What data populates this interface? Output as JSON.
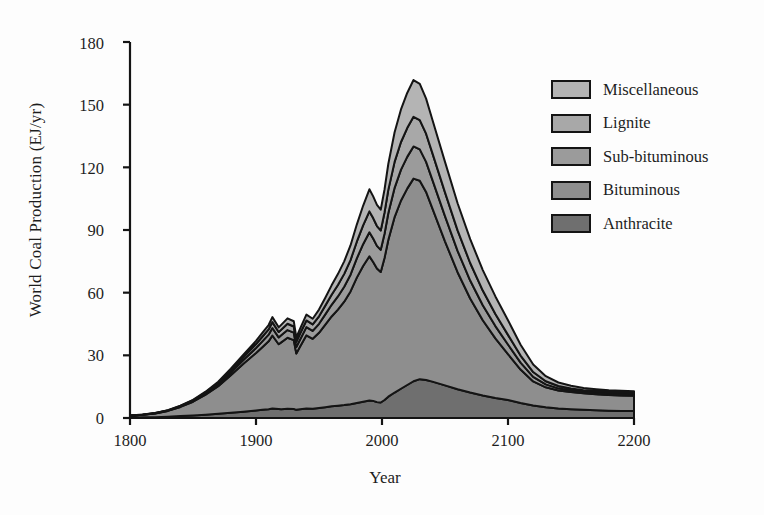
{
  "chart_data": {
    "type": "area",
    "title": "",
    "xlabel": "Year",
    "ylabel": "World Coal Production (EJ/yr)",
    "xlim": [
      1800,
      2200
    ],
    "ylim": [
      0,
      180
    ],
    "xticks": [
      1800,
      1900,
      2000,
      2100,
      2200
    ],
    "yticks": [
      0,
      30,
      60,
      90,
      120,
      150,
      180
    ],
    "grid": false,
    "stacked": true,
    "legend_position": "upper right",
    "legend_order_top_to_bottom": [
      "Miscellaneous",
      "Lignite",
      "Sub-bituminous",
      "Bituminous",
      "Anthracite"
    ],
    "stack_order_bottom_to_top": [
      "Anthracite",
      "Bituminous",
      "Sub-bituminous",
      "Lignite",
      "Miscellaneous"
    ],
    "colors": {
      "Miscellaneous": "#b4b4b4",
      "Lignite": "#a8a8a8",
      "Sub-bituminous": "#9b9b9b",
      "Bituminous": "#8e8e8e",
      "Anthracite": "#6f6f6f",
      "outline": "#141414"
    },
    "x": [
      1800,
      1810,
      1820,
      1830,
      1840,
      1850,
      1860,
      1870,
      1880,
      1890,
      1900,
      1905,
      1910,
      1913,
      1918,
      1920,
      1925,
      1930,
      1932,
      1935,
      1940,
      1945,
      1950,
      1955,
      1960,
      1965,
      1970,
      1975,
      1980,
      1985,
      1990,
      1993,
      1996,
      1999,
      2002,
      2005,
      2010,
      2015,
      2020,
      2025,
      2030,
      2035,
      2040,
      2050,
      2060,
      2070,
      2080,
      2090,
      2100,
      2110,
      2120,
      2130,
      2140,
      2150,
      2160,
      2170,
      2180,
      2190,
      2200
    ],
    "series": [
      {
        "name": "Anthracite",
        "values": [
          0.2,
          0.3,
          0.4,
          0.6,
          0.9,
          1.2,
          1.6,
          2.0,
          2.5,
          3.0,
          3.6,
          3.9,
          4.2,
          4.5,
          4.3,
          4.2,
          4.4,
          4.3,
          3.9,
          4.2,
          4.6,
          4.4,
          4.8,
          5.2,
          5.6,
          5.9,
          6.2,
          6.6,
          7.2,
          7.8,
          8.4,
          8.2,
          7.6,
          7.4,
          8.6,
          10.2,
          12.2,
          14.0,
          15.8,
          17.6,
          18.6,
          18.2,
          17.4,
          15.6,
          13.8,
          12.2,
          10.8,
          9.6,
          8.6,
          7.2,
          6.0,
          5.2,
          4.6,
          4.2,
          3.9,
          3.7,
          3.5,
          3.4,
          3.3
        ]
      },
      {
        "name": "Bituminous",
        "values": [
          0.9,
          1.2,
          1.8,
          2.8,
          4.4,
          6.6,
          9.6,
          13.2,
          18.0,
          23.0,
          27.5,
          30.0,
          32.5,
          35.0,
          31.0,
          32.0,
          34.0,
          33.0,
          27.0,
          30.0,
          35.0,
          33.5,
          36.0,
          39.5,
          43.0,
          46.0,
          49.5,
          54.0,
          60.0,
          65.0,
          69.0,
          66.5,
          64.0,
          62.5,
          68.0,
          75.0,
          84.0,
          90.0,
          94.0,
          97.0,
          95.0,
          90.0,
          83.0,
          69.0,
          56.0,
          45.0,
          36.0,
          28.5,
          22.0,
          16.0,
          11.5,
          9.5,
          8.6,
          8.2,
          7.9,
          7.7,
          7.5,
          7.4,
          7.3
        ]
      },
      {
        "name": "Sub-bituminous",
        "values": [
          0.05,
          0.07,
          0.1,
          0.15,
          0.25,
          0.4,
          0.6,
          0.9,
          1.3,
          1.8,
          2.4,
          2.8,
          3.2,
          3.6,
          3.3,
          3.4,
          3.7,
          3.6,
          3.1,
          3.4,
          3.9,
          3.8,
          4.3,
          4.9,
          5.6,
          6.3,
          7.1,
          8.0,
          9.2,
          10.4,
          11.5,
          11.2,
          10.8,
          10.6,
          11.6,
          12.8,
          14.0,
          14.8,
          15.2,
          15.4,
          15.0,
          14.4,
          13.6,
          12.0,
          10.2,
          8.6,
          7.2,
          5.9,
          4.6,
          3.3,
          2.2,
          1.4,
          1.0,
          0.8,
          0.7,
          0.65,
          0.6,
          0.6,
          0.6
        ]
      },
      {
        "name": "Lignite",
        "values": [
          0.03,
          0.04,
          0.06,
          0.1,
          0.18,
          0.3,
          0.45,
          0.7,
          1.0,
          1.4,
          1.9,
          2.2,
          2.5,
          2.8,
          2.6,
          2.7,
          3.0,
          2.9,
          2.5,
          2.8,
          3.2,
          3.1,
          3.6,
          4.2,
          4.8,
          5.5,
          6.2,
          7.0,
          8.0,
          9.0,
          10.0,
          9.8,
          9.5,
          9.3,
          10.2,
          11.2,
          12.4,
          13.2,
          13.8,
          14.2,
          14.0,
          13.5,
          12.8,
          11.4,
          9.8,
          8.4,
          7.0,
          5.8,
          4.6,
          3.4,
          2.3,
          1.5,
          1.1,
          0.9,
          0.8,
          0.75,
          0.7,
          0.7,
          0.7
        ]
      },
      {
        "name": "Miscellaneous",
        "values": [
          0.02,
          0.03,
          0.05,
          0.08,
          0.14,
          0.22,
          0.35,
          0.55,
          0.8,
          1.1,
          1.5,
          1.8,
          2.1,
          2.4,
          2.2,
          2.3,
          2.6,
          2.5,
          2.1,
          2.4,
          2.8,
          2.7,
          3.2,
          3.8,
          4.5,
          5.2,
          6.0,
          7.0,
          8.2,
          9.4,
          10.6,
          10.4,
          10.1,
          9.9,
          11.0,
          12.4,
          14.2,
          15.6,
          16.8,
          17.6,
          17.4,
          16.8,
          16.0,
          14.6,
          13.0,
          11.4,
          9.8,
          8.4,
          7.0,
          5.2,
          3.6,
          2.4,
          1.7,
          1.3,
          1.1,
          1.0,
          0.95,
          0.9,
          0.9
        ]
      }
    ],
    "peak": {
      "year": 2030,
      "total": 156
    },
    "annotations": []
  },
  "axes": {
    "ylabel": "World Coal Production (EJ/yr)",
    "xlabel": "Year",
    "yticks": [
      "180",
      "150",
      "120",
      "90",
      "60",
      "30",
      "0"
    ],
    "xticks": [
      "1800",
      "1900",
      "2000",
      "2100",
      "2200"
    ]
  },
  "legend": {
    "items": [
      {
        "label": "Miscellaneous",
        "color": "#b4b4b4"
      },
      {
        "label": "Lignite",
        "color": "#a8a8a8"
      },
      {
        "label": "Sub-bituminous",
        "color": "#9b9b9b"
      },
      {
        "label": "Bituminous",
        "color": "#8e8e8e"
      },
      {
        "label": "Anthracite",
        "color": "#6f6f6f"
      }
    ]
  }
}
